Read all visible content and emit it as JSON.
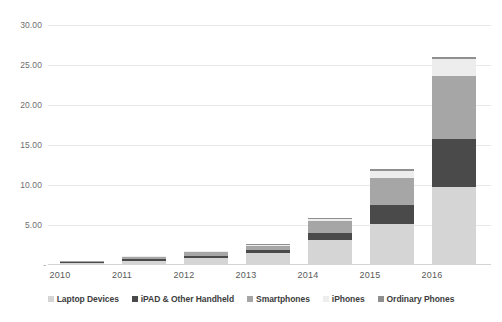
{
  "chart_data": {
    "type": "bar",
    "stacked": true,
    "title": "",
    "xlabel": "",
    "ylabel": "",
    "categories": [
      "2010",
      "2011",
      "2012",
      "2013",
      "2014",
      "2015",
      "2016"
    ],
    "ylim": [
      0,
      30
    ],
    "yticks": [
      0,
      5,
      10,
      15,
      20,
      25,
      30
    ],
    "ytick_labels": [
      "-",
      "5.00",
      "10.00",
      "15.00",
      "20.00",
      "25.00",
      "30.00"
    ],
    "grid": true,
    "legend_position": "bottom",
    "series": [
      {
        "name": "Laptop Devices",
        "color": "#d5d5d5",
        "values": [
          0.25,
          0.55,
          0.9,
          1.55,
          3.1,
          5.15,
          9.8
        ]
      },
      {
        "name": "iPAD & Other Handheld",
        "color": "#4a4a4a",
        "values": [
          0.1,
          0.15,
          0.2,
          0.3,
          0.9,
          2.35,
          6.0
        ]
      },
      {
        "name": "Smartphones",
        "color": "#a6a6a6",
        "values": [
          0.12,
          0.3,
          0.5,
          0.55,
          1.45,
          3.4,
          7.85
        ]
      },
      {
        "name": "iPhones",
        "color": "#ededed",
        "values": [
          0.03,
          0.07,
          0.1,
          0.15,
          0.35,
          0.85,
          2.05
        ]
      },
      {
        "name": "Ordinary Phones",
        "color": "#8f8f8f",
        "values": [
          0.02,
          0.04,
          0.06,
          0.07,
          0.12,
          0.3,
          0.35
        ]
      }
    ],
    "totals": [
      0.52,
      1.11,
      1.76,
      2.62,
      5.92,
      12.05,
      26.05
    ]
  }
}
